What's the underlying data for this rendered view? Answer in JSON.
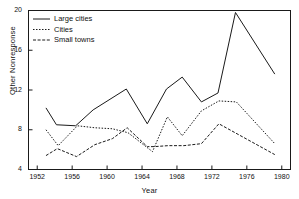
{
  "chart_data": {
    "type": "line",
    "title": "",
    "xlabel": "Year",
    "ylabel": "Other Nonresponse",
    "xlim": [
      1951,
      1981
    ],
    "ylim": [
      4,
      20
    ],
    "xticks": [
      1952,
      1956,
      1960,
      1964,
      1968,
      1972,
      1976,
      1980
    ],
    "yticks": [
      4,
      8,
      12,
      16,
      20
    ],
    "grid": false,
    "legend_position": "top-left",
    "series": [
      {
        "name": "Large cities",
        "style": "solid",
        "color": "#1a1a1a",
        "points": [
          [
            1953,
            10.2
          ],
          [
            1954.2,
            8.5
          ],
          [
            1956.4,
            8.4
          ],
          [
            1958.4,
            10.0
          ],
          [
            1962.2,
            12.1
          ],
          [
            1964.6,
            8.6
          ],
          [
            1966.8,
            12.1
          ],
          [
            1968.6,
            13.3
          ],
          [
            1970.8,
            10.8
          ],
          [
            1972.7,
            11.7
          ],
          [
            1974.7,
            19.8
          ],
          [
            1979.2,
            13.6
          ]
        ]
      },
      {
        "name": "Cities",
        "style": "dotted",
        "color": "#1a1a1a",
        "points": [
          [
            1953,
            8.0
          ],
          [
            1954.4,
            6.4
          ],
          [
            1956.6,
            8.4
          ],
          [
            1958.6,
            8.2
          ],
          [
            1960.6,
            8.1
          ],
          [
            1962.4,
            7.7
          ],
          [
            1964.6,
            6.2
          ],
          [
            1965.2,
            5.8
          ],
          [
            1966.9,
            9.3
          ],
          [
            1968.6,
            7.4
          ],
          [
            1970.8,
            9.9
          ],
          [
            1972.8,
            10.9
          ],
          [
            1974.8,
            10.8
          ],
          [
            1979.2,
            6.6
          ]
        ]
      },
      {
        "name": "Small towns",
        "style": "dashed",
        "color": "#1a1a1a",
        "points": [
          [
            1953,
            5.4
          ],
          [
            1954.3,
            6.1
          ],
          [
            1956.5,
            5.3
          ],
          [
            1958.6,
            6.5
          ],
          [
            1960.6,
            7.1
          ],
          [
            1962.3,
            8.2
          ],
          [
            1964.6,
            6.3
          ],
          [
            1965.4,
            6.3
          ],
          [
            1967.0,
            6.4
          ],
          [
            1968.8,
            6.4
          ],
          [
            1970.8,
            6.6
          ],
          [
            1972.8,
            8.6
          ],
          [
            1979.2,
            5.5
          ]
        ]
      }
    ]
  },
  "legend": {
    "items": [
      {
        "label": "Large cities"
      },
      {
        "label": "Cities"
      },
      {
        "label": "Small towns"
      }
    ]
  },
  "axes": {
    "x_title": "Year",
    "y_title": "Other Nonresponse",
    "x_tick_labels": [
      "1952",
      "1956",
      "1960",
      "1964",
      "1968",
      "1972",
      "1976",
      "1980"
    ],
    "y_tick_labels": [
      "4",
      "8",
      "12",
      "16",
      "20"
    ]
  }
}
